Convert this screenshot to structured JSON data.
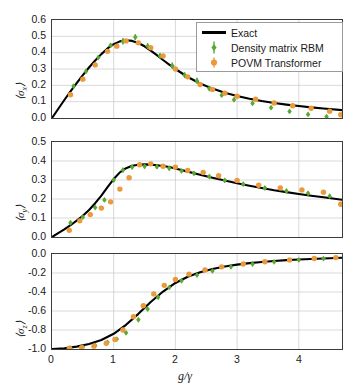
{
  "figure": {
    "width": 358,
    "height": 390,
    "background": "#ffffff"
  },
  "legend": {
    "position": "top-right-panel-1",
    "items": [
      {
        "label": "Exact",
        "marker": "line",
        "color": "#000000"
      },
      {
        "label": "Density matrix RBM",
        "marker": "diamond-errorbar",
        "color": "#5aa832"
      },
      {
        "label": "POVM Transformer",
        "marker": "circle-errorbar",
        "color": "#e89a3c"
      }
    ]
  },
  "axis": {
    "xlabel": "g/γ",
    "xticks": [
      "0",
      "1",
      "2",
      "3",
      "4"
    ],
    "xtickvals": [
      0,
      1,
      2,
      3,
      4
    ],
    "xlim": [
      0,
      4.7
    ]
  },
  "colors": {
    "exact": "#000000",
    "rbm": "#5aa832",
    "povm": "#e89a3c",
    "frame": "#3c3c3c",
    "grid": "#c8c8c8"
  },
  "chart_data": [
    {
      "type": "line",
      "panel": "top",
      "title": "",
      "xlabel": "",
      "ylabel": "⟨σ_x⟩",
      "ylabel_parts": {
        "open": "⟨",
        "sym": "σ",
        "sub": "x",
        "close": "⟩"
      },
      "xlim": [
        0,
        4.7
      ],
      "ylim": [
        0,
        0.6
      ],
      "yticks": [
        "0.0",
        "0.1",
        "0.2",
        "0.3",
        "0.4",
        "0.5",
        "0.6"
      ],
      "ytickvals": [
        0.0,
        0.1,
        0.2,
        0.3,
        0.4,
        0.5,
        0.6
      ],
      "grid": true,
      "series": [
        {
          "name": "Exact",
          "type": "line",
          "color": "#000000",
          "x": [
            0.0,
            0.1,
            0.2,
            0.3,
            0.4,
            0.5,
            0.6,
            0.7,
            0.8,
            0.9,
            1.0,
            1.1,
            1.2,
            1.3,
            1.4,
            1.5,
            1.6,
            1.7,
            1.8,
            1.9,
            2.0,
            2.2,
            2.4,
            2.6,
            2.8,
            3.0,
            3.2,
            3.4,
            3.6,
            3.8,
            4.0,
            4.2,
            4.4,
            4.7
          ],
          "y": [
            0.0,
            0.055,
            0.11,
            0.163,
            0.213,
            0.262,
            0.309,
            0.352,
            0.391,
            0.426,
            0.452,
            0.469,
            0.476,
            0.472,
            0.459,
            0.439,
            0.413,
            0.385,
            0.355,
            0.327,
            0.3,
            0.251,
            0.211,
            0.18,
            0.155,
            0.135,
            0.118,
            0.104,
            0.092,
            0.082,
            0.073,
            0.065,
            0.058,
            0.048
          ]
        },
        {
          "name": "Density matrix RBM",
          "type": "scatter-errorbar",
          "color": "#5aa832",
          "x": [
            0.35,
            0.55,
            0.75,
            0.95,
            1.15,
            1.35,
            1.55,
            1.75,
            1.95,
            2.15,
            2.35,
            2.55,
            2.75,
            2.95,
            3.25,
            3.55,
            3.85,
            4.15,
            4.45
          ],
          "y": [
            0.195,
            0.285,
            0.37,
            0.445,
            0.47,
            0.495,
            0.44,
            0.38,
            0.32,
            0.262,
            0.228,
            0.18,
            0.14,
            0.112,
            0.09,
            0.063,
            0.04,
            0.022,
            0.008
          ],
          "yerr": [
            0.012,
            0.012,
            0.012,
            0.012,
            0.02,
            0.018,
            0.018,
            0.018,
            0.02,
            0.018,
            0.018,
            0.014,
            0.012,
            0.012,
            0.01,
            0.01,
            0.01,
            0.01,
            0.01
          ]
        },
        {
          "name": "POVM Transformer",
          "type": "scatter-errorbar",
          "color": "#e89a3c",
          "x": [
            0.3,
            0.5,
            0.7,
            0.9,
            1.05,
            1.2,
            1.4,
            1.6,
            1.8,
            2.0,
            2.2,
            2.4,
            2.6,
            2.8,
            3.0,
            3.3,
            3.6,
            3.9,
            4.2,
            4.5,
            4.68
          ],
          "y": [
            0.142,
            0.238,
            0.325,
            0.408,
            0.44,
            0.472,
            0.46,
            0.43,
            0.38,
            0.3,
            0.252,
            0.205,
            0.175,
            0.152,
            0.133,
            0.115,
            0.092,
            0.075,
            0.06,
            0.042,
            0.02
          ],
          "yerr": [
            0.008,
            0.008,
            0.008,
            0.008,
            0.008,
            0.01,
            0.01,
            0.01,
            0.01,
            0.008,
            0.008,
            0.008,
            0.008,
            0.008,
            0.008,
            0.008,
            0.008,
            0.008,
            0.008,
            0.008,
            0.008
          ]
        }
      ]
    },
    {
      "type": "line",
      "panel": "middle",
      "title": "",
      "xlabel": "",
      "ylabel": "⟨σ_y⟩",
      "ylabel_parts": {
        "open": "⟨",
        "sym": "σ",
        "sub": "y",
        "close": "⟩"
      },
      "xlim": [
        0,
        4.7
      ],
      "ylim": [
        0,
        0.5
      ],
      "yticks": [
        "0.0",
        "0.1",
        "0.2",
        "0.3",
        "0.4",
        "0.5"
      ],
      "ytickvals": [
        0.0,
        0.1,
        0.2,
        0.3,
        0.4,
        0.5
      ],
      "grid": true,
      "series": [
        {
          "name": "Exact",
          "type": "line",
          "color": "#000000",
          "x": [
            0.0,
            0.1,
            0.2,
            0.3,
            0.4,
            0.5,
            0.6,
            0.7,
            0.8,
            0.9,
            1.0,
            1.1,
            1.2,
            1.3,
            1.4,
            1.5,
            1.6,
            1.7,
            1.8,
            1.9,
            2.0,
            2.2,
            2.4,
            2.6,
            2.8,
            3.0,
            3.2,
            3.4,
            3.6,
            3.8,
            4.0,
            4.2,
            4.4,
            4.7
          ],
          "y": [
            0.0,
            0.02,
            0.04,
            0.062,
            0.086,
            0.112,
            0.142,
            0.178,
            0.218,
            0.262,
            0.305,
            0.34,
            0.362,
            0.375,
            0.38,
            0.382,
            0.381,
            0.378,
            0.374,
            0.368,
            0.36,
            0.344,
            0.328,
            0.312,
            0.297,
            0.283,
            0.27,
            0.258,
            0.246,
            0.236,
            0.226,
            0.217,
            0.209,
            0.196
          ]
        },
        {
          "name": "Density matrix RBM",
          "type": "scatter-errorbar",
          "color": "#5aa832",
          "x": [
            0.3,
            0.5,
            0.7,
            0.85,
            1.0,
            1.15,
            1.3,
            1.5,
            1.7,
            1.9,
            2.1,
            2.3,
            2.55,
            2.8,
            3.1,
            3.45,
            3.8,
            4.15,
            4.5
          ],
          "y": [
            0.075,
            0.105,
            0.155,
            0.195,
            0.3,
            0.352,
            0.368,
            0.372,
            0.37,
            0.362,
            0.348,
            0.335,
            0.318,
            0.298,
            0.278,
            0.258,
            0.242,
            0.23,
            0.215
          ],
          "yerr": [
            0.008,
            0.008,
            0.008,
            0.01,
            0.01,
            0.012,
            0.012,
            0.012,
            0.012,
            0.012,
            0.01,
            0.01,
            0.01,
            0.01,
            0.01,
            0.01,
            0.01,
            0.01,
            0.01
          ]
        },
        {
          "name": "POVM Transformer",
          "type": "scatter-errorbar",
          "color": "#e89a3c",
          "x": [
            0.28,
            0.45,
            0.62,
            0.8,
            0.95,
            1.1,
            1.25,
            1.42,
            1.6,
            1.8,
            2.0,
            2.2,
            2.45,
            2.7,
            3.0,
            3.35,
            3.7,
            4.05,
            4.4,
            4.68
          ],
          "y": [
            0.035,
            0.085,
            0.118,
            0.152,
            0.185,
            0.252,
            0.312,
            0.38,
            0.385,
            0.372,
            0.368,
            0.35,
            0.34,
            0.322,
            0.298,
            0.272,
            0.258,
            0.248,
            0.236,
            0.172
          ]
        }
      ]
    },
    {
      "type": "line",
      "panel": "bottom",
      "title": "",
      "xlabel": "g/γ",
      "ylabel": "⟨σ_z⟩",
      "ylabel_parts": {
        "open": "⟨",
        "sym": "σ",
        "sub": "z",
        "close": "⟩"
      },
      "xlim": [
        0,
        4.7
      ],
      "ylim": [
        -1.0,
        0.0
      ],
      "yticks": [
        "-1.0",
        "-0.8",
        "-0.6",
        "-0.4",
        "-0.2",
        "0.0"
      ],
      "ytickvals": [
        -1.0,
        -0.8,
        -0.6,
        -0.4,
        -0.2,
        0.0
      ],
      "grid": true,
      "series": [
        {
          "name": "Exact",
          "type": "line",
          "color": "#000000",
          "x": [
            0.0,
            0.2,
            0.4,
            0.6,
            0.8,
            1.0,
            1.2,
            1.4,
            1.6,
            1.8,
            2.0,
            2.2,
            2.4,
            2.6,
            2.8,
            3.0,
            3.2,
            3.4,
            3.6,
            3.8,
            4.0,
            4.2,
            4.4,
            4.7
          ],
          "y": [
            -1.0,
            -0.992,
            -0.975,
            -0.948,
            -0.905,
            -0.84,
            -0.745,
            -0.63,
            -0.505,
            -0.395,
            -0.305,
            -0.24,
            -0.192,
            -0.158,
            -0.132,
            -0.112,
            -0.096,
            -0.084,
            -0.073,
            -0.065,
            -0.058,
            -0.052,
            -0.047,
            -0.04
          ]
        },
        {
          "name": "Density matrix RBM",
          "type": "scatter-errorbar",
          "color": "#5aa832",
          "x": [
            0.3,
            0.5,
            0.7,
            0.9,
            1.05,
            1.2,
            1.4,
            1.55,
            1.72,
            1.9,
            2.1,
            2.35,
            2.6,
            2.9,
            3.25,
            3.6,
            4.0,
            4.4
          ],
          "y": [
            -0.99,
            -0.98,
            -0.962,
            -0.93,
            -0.895,
            -0.83,
            -0.692,
            -0.58,
            -0.455,
            -0.352,
            -0.282,
            -0.222,
            -0.178,
            -0.135,
            -0.105,
            -0.082,
            -0.062,
            -0.048
          ]
        },
        {
          "name": "POVM Transformer",
          "type": "scatter-errorbar",
          "color": "#e89a3c",
          "x": [
            0.28,
            0.48,
            0.68,
            0.88,
            1.02,
            1.15,
            1.32,
            1.48,
            1.65,
            1.82,
            2.0,
            2.22,
            2.48,
            2.75,
            3.1,
            3.45,
            3.85,
            4.25,
            4.6
          ],
          "y": [
            -0.992,
            -0.985,
            -0.97,
            -0.94,
            -0.9,
            -0.8,
            -0.66,
            -0.545,
            -0.42,
            -0.33,
            -0.268,
            -0.212,
            -0.168,
            -0.135,
            -0.105,
            -0.082,
            -0.062,
            -0.048,
            -0.038
          ]
        }
      ]
    }
  ]
}
